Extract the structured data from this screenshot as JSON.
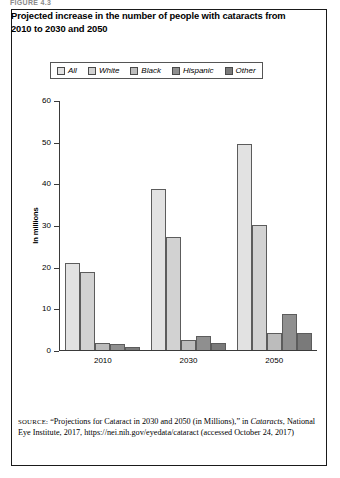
{
  "figure_label": "FIGURE 4.3",
  "title": "Projected increase in the number of people with cataracts from 2010 to 2030 and 2050",
  "legend": {
    "items": [
      {
        "label": "All",
        "color": "#e2e2e2"
      },
      {
        "label": "White",
        "color": "#d2d2d2"
      },
      {
        "label": "Black",
        "color": "#bcbcbc"
      },
      {
        "label": "Hispanic",
        "color": "#8f8f8f"
      },
      {
        "label": "Other",
        "color": "#7a7a7a"
      }
    ]
  },
  "source": {
    "prefix": "SOURCE:",
    "text_1": " “Projections for Cataract in 2030 and 2050 (in Millions),” in ",
    "italic": "Cataracts",
    "text_2": ", National Eye Institute, 2017, https://nei.nih.gov/eyedata/cataract (accessed October 24, 2017)"
  },
  "chart_data": {
    "type": "bar",
    "title": "Projected increase in the number of people with cataracts from 2010 to 2030 and 2050",
    "xlabel": "",
    "ylabel": "In millions",
    "ylim": [
      0,
      60
    ],
    "yticks": [
      0,
      10,
      20,
      30,
      40,
      50,
      60
    ],
    "grid": false,
    "legend_position": "top",
    "categories": [
      "2010",
      "2030",
      "2050"
    ],
    "series": [
      {
        "name": "All",
        "color": "#e2e2e2",
        "values": [
          21.0,
          38.7,
          49.4
        ]
      },
      {
        "name": "White",
        "color": "#d2d2d2",
        "values": [
          18.8,
          27.2,
          30.0
        ]
      },
      {
        "name": "Black",
        "color": "#bcbcbc",
        "values": [
          1.8,
          2.4,
          4.2
        ]
      },
      {
        "name": "Hispanic",
        "color": "#8f8f8f",
        "values": [
          1.4,
          3.4,
          8.6
        ]
      },
      {
        "name": "Other",
        "color": "#7a7a7a",
        "values": [
          0.7,
          1.7,
          4.2
        ]
      }
    ]
  }
}
